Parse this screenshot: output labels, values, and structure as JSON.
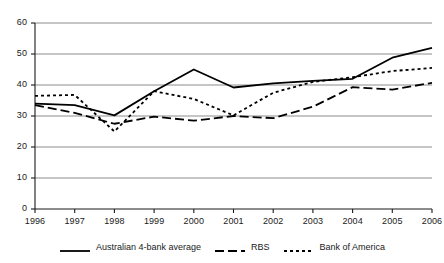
{
  "chart_data": {
    "type": "line",
    "title": "",
    "subtitle": "",
    "xlabel": "",
    "ylabel": "",
    "categories": [
      "1996",
      "1997",
      "1998",
      "1999",
      "2000",
      "2001",
      "2002",
      "2003",
      "2004",
      "2005",
      "2006"
    ],
    "x": [
      1996,
      1997,
      1998,
      1999,
      2000,
      2001,
      2002,
      2003,
      2004,
      2005,
      2006
    ],
    "ylim": [
      0,
      60
    ],
    "yticks": [
      0,
      10,
      20,
      30,
      40,
      50,
      60
    ],
    "ytick_labels": [
      "0",
      "10",
      "20",
      "30",
      "40",
      "50",
      "60"
    ],
    "grid": "horizontal",
    "legend_position": "bottom",
    "series": [
      {
        "name": "Australian 4-bank average",
        "style": "solid",
        "color": "#000000",
        "values": [
          34,
          33.5,
          30.2,
          38,
          45,
          39.2,
          40.5,
          41.3,
          42,
          48.8,
          52
        ]
      },
      {
        "name": "RBS",
        "style": "long-dash",
        "color": "#000000",
        "values": [
          33.5,
          31,
          27.5,
          29.8,
          28.5,
          30,
          29.3,
          33,
          39.3,
          38.5,
          40.7
        ]
      },
      {
        "name": "Bank of America",
        "style": "dotted",
        "color": "#000000",
        "values": [
          36.5,
          36.8,
          25,
          38,
          35.5,
          30.2,
          37.5,
          41,
          42.5,
          44.5,
          45.5
        ]
      }
    ]
  },
  "axes": {
    "y_ticks": [
      {
        "label": "60"
      },
      {
        "label": "50"
      },
      {
        "label": "40"
      },
      {
        "label": "30"
      },
      {
        "label": "20"
      },
      {
        "label": "10"
      },
      {
        "label": "0"
      }
    ],
    "x_ticks": [
      {
        "label": "1996"
      },
      {
        "label": "1997"
      },
      {
        "label": "1998"
      },
      {
        "label": "1999"
      },
      {
        "label": "2000"
      },
      {
        "label": "2001"
      },
      {
        "label": "2002"
      },
      {
        "label": "2003"
      },
      {
        "label": "2004"
      },
      {
        "label": "2005"
      },
      {
        "label": "2006"
      }
    ]
  },
  "legend": {
    "entries": [
      {
        "label": "Australian 4-bank average",
        "style": "solid"
      },
      {
        "label": "RBS",
        "style": "long-dash"
      },
      {
        "label": "Bank of America",
        "style": "dotted"
      }
    ]
  },
  "colors": {
    "line": "#000000",
    "grid": "#8c8c8c",
    "axis": "#1a1a1a",
    "background": "#ffffff"
  }
}
